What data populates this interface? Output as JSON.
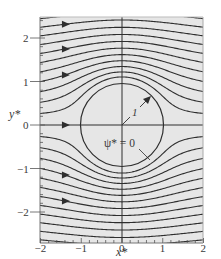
{
  "chart_data": {
    "type": "line",
    "title": "",
    "xlabel": "x*",
    "ylabel": "y*",
    "xlim": [
      -2,
      2
    ],
    "ylim": [
      -2,
      2.5
    ],
    "xticks": [
      "-2",
      "-1",
      "0",
      "1",
      "2"
    ],
    "yticks": [
      "-2",
      "-1",
      "0",
      "1",
      "2"
    ],
    "grid": false,
    "legend": null,
    "streamline_psi_values": [
      -2.4,
      -2.2,
      -2.0,
      -1.8,
      -1.6,
      -1.4,
      -1.2,
      -1.0,
      -0.8,
      -0.6,
      -0.4,
      -0.2,
      0,
      0.2,
      0.4,
      0.6,
      0.8,
      1.0,
      1.2,
      1.4,
      1.6,
      1.8,
      2.0,
      2.2,
      2.4
    ],
    "cylinder_radius": 1,
    "flow_direction": "left-to-right",
    "annotations": [
      {
        "text": "1",
        "meaning": "cylinder radius arrow"
      },
      {
        "text": "ψ* = 0",
        "meaning": "dividing streamline / cylinder surface"
      }
    ]
  },
  "labels": {
    "xlabel": "x*",
    "ylabel": "y*",
    "radius": "1",
    "psi_zero": "ψ* = 0"
  },
  "colors": {
    "plot_bg": "#e6e6e6",
    "line": "#2e2e2e",
    "axis": "#555555"
  }
}
